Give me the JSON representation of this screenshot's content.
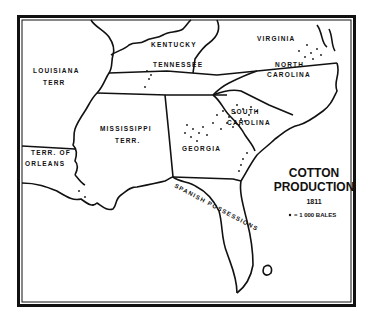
{
  "map": {
    "title_line1": "COTTON",
    "title_line2": "PRODUCTION",
    "year": "1811",
    "legend": {
      "symbol": "dot",
      "text": "= 1 000 BALES"
    },
    "regions": [
      {
        "id": "louisiana-terr",
        "label_line1": "LOUISIANA",
        "label_line2": "TERR"
      },
      {
        "id": "kentucky",
        "label_line1": "KENTUCKY"
      },
      {
        "id": "virginia",
        "label_line1": "VIRGINIA"
      },
      {
        "id": "tennessee",
        "label_line1": "TENNESSEE"
      },
      {
        "id": "north-carolina",
        "label_line1": "NORTH",
        "label_line2": "CAROLINA"
      },
      {
        "id": "mississippi-terr",
        "label_line1": "MISSISSIPPI",
        "label_line2": "TERR."
      },
      {
        "id": "south-carolina",
        "label_line1": "SOUTH",
        "label_line2": "CAROLINA"
      },
      {
        "id": "georgia",
        "label_line1": "GEORGIA"
      },
      {
        "id": "terr-of-orleans",
        "label_line1": "TERR. OF",
        "label_line2": "ORLEANS"
      },
      {
        "id": "spanish-possessions",
        "label_line1": "SPANISH POSSESSIONS"
      }
    ],
    "colors": {
      "ink": "#111111",
      "paper": "#ffffff"
    }
  }
}
